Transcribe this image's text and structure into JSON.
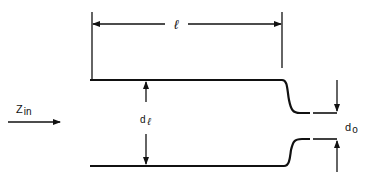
{
  "diagram": {
    "type": "stepped transmission line cross-section",
    "labels": {
      "length": "ℓ",
      "input_impedance_main": "Z",
      "input_impedance_sub": "in",
      "line_diameter_main": "d",
      "line_diameter_sub": "ℓ",
      "output_diameter_main": "d",
      "output_diameter_sub": "o"
    },
    "colors": {
      "stroke": "#111111",
      "background": "#ffffff"
    }
  }
}
